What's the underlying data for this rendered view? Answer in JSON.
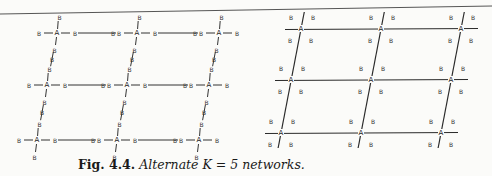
{
  "caption": {
    "figure_label": "Fig. 4.4.",
    "text": "Alternate K = 5 networks."
  },
  "diagrams": {
    "left": {
      "description": "Network where each A node is connected to 4 adjacent B nodes; B nodes connect A nodes along lines",
      "hub_label": "A",
      "node_label": "B",
      "a_nodes": [
        [
          57,
          33
        ],
        [
          137,
          33
        ],
        [
          219,
          33
        ],
        [
          47,
          85
        ],
        [
          127,
          85
        ],
        [
          209,
          85
        ],
        [
          37,
          140
        ],
        [
          117,
          140
        ],
        [
          199,
          140
        ]
      ]
    },
    "right": {
      "description": "Grid network of A nodes at line intersections with B nodes placed in each cell",
      "hub_label": "A",
      "node_label": "B",
      "a_nodes": [
        [
          301,
          29
        ],
        [
          381,
          29
        ],
        [
          461,
          29
        ],
        [
          291,
          80
        ],
        [
          371,
          80
        ],
        [
          451,
          80
        ],
        [
          281,
          133
        ],
        [
          361,
          133
        ],
        [
          441,
          133
        ]
      ]
    }
  }
}
